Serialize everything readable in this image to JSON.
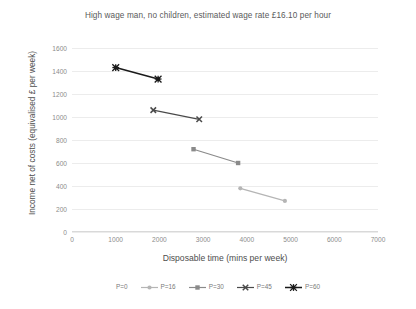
{
  "chart_data": {
    "type": "line",
    "title": "High wage man, no children, estimated wage rate £16.10 per hour",
    "xlabel": "Disposable time (mins per week)",
    "ylabel": "Income net of costs (equivalised £ per week)",
    "xlim": [
      0,
      7000
    ],
    "ylim": [
      0,
      1600
    ],
    "xticks": [
      "0",
      "1000",
      "2000",
      "3000",
      "4000",
      "5000",
      "6000",
      "7000"
    ],
    "yticks": [
      "0",
      "200",
      "400",
      "600",
      "800",
      "1000",
      "1200",
      "1400",
      "1600"
    ],
    "grid": true,
    "legend_position": "bottom",
    "series": [
      {
        "name": "P=0",
        "color": "#b0b0b0",
        "marker": "none",
        "points": []
      },
      {
        "name": "P=16",
        "color": "#b5b5b5",
        "marker": "circle",
        "points": [
          [
            3850,
            380
          ],
          [
            4870,
            270
          ]
        ]
      },
      {
        "name": "P=30",
        "color": "#8a8a8a",
        "marker": "square",
        "points": [
          [
            2780,
            720
          ],
          [
            3800,
            600
          ]
        ]
      },
      {
        "name": "P=45",
        "color": "#4a4a4a",
        "marker": "x",
        "points": [
          [
            1860,
            1060
          ],
          [
            2910,
            980
          ]
        ]
      },
      {
        "name": "P=60",
        "color": "#1a1a1a",
        "marker": "star",
        "points": [
          [
            1000,
            1430
          ],
          [
            1970,
            1330
          ]
        ]
      }
    ]
  }
}
